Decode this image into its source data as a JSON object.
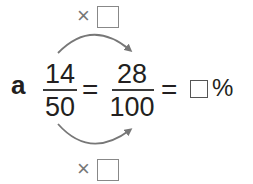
{
  "problem": {
    "label": "a",
    "fraction1": {
      "numerator": "14",
      "denominator": "50"
    },
    "equals1": "=",
    "fraction2": {
      "numerator": "28",
      "denominator": "100"
    },
    "equals2": "=",
    "answer_box": "",
    "percent_sign": "%"
  },
  "top_multiplier": {
    "symbol": "×",
    "box": ""
  },
  "bottom_multiplier": {
    "symbol": "×",
    "box": ""
  },
  "colors": {
    "text": "#231f20",
    "arrow": "#777777"
  }
}
